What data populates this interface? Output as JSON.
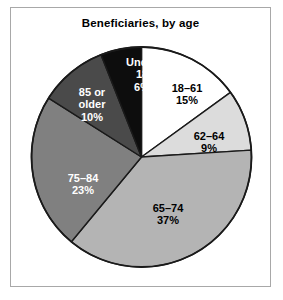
{
  "figure": {
    "title": "Beneficiaries, by age",
    "frame_color": "#a8a8a8",
    "background": "#ffffff"
  },
  "chart_data": {
    "type": "pie",
    "title": "Beneficiaries, by age",
    "xlabel": "",
    "ylabel": "",
    "legend_position": "none",
    "grid": false,
    "units": "percent",
    "start_angle_deg": 0,
    "direction": "clockwise",
    "categories": [
      "18–61",
      "62–64",
      "65–74",
      "75–84",
      "85 or older",
      "Under 18"
    ],
    "values": [
      15,
      9,
      37,
      23,
      10,
      6
    ],
    "labels": [
      "15%",
      "9%",
      "37%",
      "23%",
      "10%",
      "6%"
    ],
    "colors": [
      "#ffffff",
      "#dcdcdc",
      "#b4b4b4",
      "#808080",
      "#4a4a4a",
      "#0d0d0d"
    ],
    "slices": [
      {
        "name": "18–61",
        "name_lines": [
          "18–61"
        ],
        "value": 15,
        "label": "15%",
        "color": "#ffffff",
        "text_color": "#000000",
        "text_on": "light",
        "label_x": 176,
        "label_y": 74
      },
      {
        "name": "62–64",
        "name_lines": [
          "62–64"
        ],
        "value": 9,
        "label": "9%",
        "color": "#dcdcdc",
        "text_color": "#000000",
        "text_on": "light",
        "label_x": 198,
        "label_y": 122
      },
      {
        "name": "65–74",
        "name_lines": [
          "65–74"
        ],
        "value": 37,
        "label": "37%",
        "color": "#b4b4b4",
        "text_color": "#000000",
        "text_on": "light",
        "label_x": 157,
        "label_y": 194
      },
      {
        "name": "75–84",
        "name_lines": [
          "75–84"
        ],
        "value": 23,
        "label": "23%",
        "color": "#808080",
        "text_color": "#ffffff",
        "text_on": "dark",
        "label_x": 72,
        "label_y": 164
      },
      {
        "name": "85 or older",
        "name_lines": [
          "85 or",
          "older"
        ],
        "value": 10,
        "label": "10%",
        "color": "#4a4a4a",
        "text_color": "#ffffff",
        "text_on": "dark",
        "label_x": 81,
        "label_y": 78
      },
      {
        "name": "Under 18",
        "name_lines": [
          "Under",
          "18"
        ],
        "value": 6,
        "label": "6%",
        "color": "#0d0d0d",
        "text_color": "#ffffff",
        "text_on": "dark",
        "label_x": 131,
        "label_y": 48
      }
    ]
  }
}
